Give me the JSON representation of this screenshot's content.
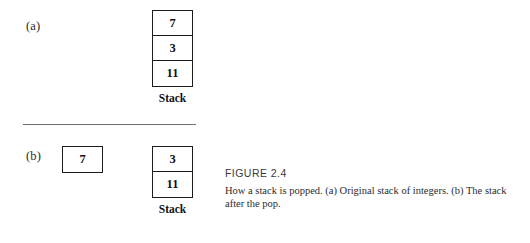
{
  "figure": {
    "number_label": "FIGURE 2.4",
    "caption_lines": [
      "How a stack is popped. (a) Original stack of integers. (b) The stack",
      "after the pop."
    ],
    "caption_full": "How a stack is popped. (a) Original stack of integers. (b) The stack after the pop."
  },
  "panels": {
    "a": {
      "label": "(a)",
      "stack": {
        "caption": "Stack",
        "cells": [
          "7",
          "3",
          "11"
        ]
      }
    },
    "b": {
      "label": "(b)",
      "popped": {
        "value": "7"
      },
      "stack": {
        "caption": "Stack",
        "cells": [
          "3",
          "11"
        ]
      }
    }
  },
  "style": {
    "border_color": "#1c1c1c",
    "divider_color": "#6f6f6f",
    "text_color": "#1a1a1a",
    "background": "#ffffff"
  }
}
